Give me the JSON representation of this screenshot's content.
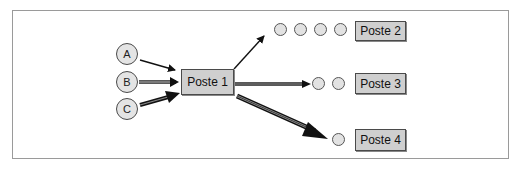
{
  "diagram": {
    "type": "flow",
    "sources": [
      {
        "id": "A",
        "label": "A",
        "flow": "thin"
      },
      {
        "id": "B",
        "label": "B",
        "flow": "double"
      },
      {
        "id": "C",
        "label": "C",
        "flow": "thick"
      }
    ],
    "hub": {
      "label": "Poste 1"
    },
    "targets": [
      {
        "label": "Poste 2",
        "queue_length": 4,
        "flow": "thin"
      },
      {
        "label": "Poste 3",
        "queue_length": 2,
        "flow": "double"
      },
      {
        "label": "Poste 4",
        "queue_length": 1,
        "flow": "thick"
      }
    ],
    "colors": {
      "box_fill": "#cfcfcf",
      "circle_fill": "#e2e2e2",
      "stroke": "#222222",
      "frame": "#9a9a9a"
    }
  }
}
